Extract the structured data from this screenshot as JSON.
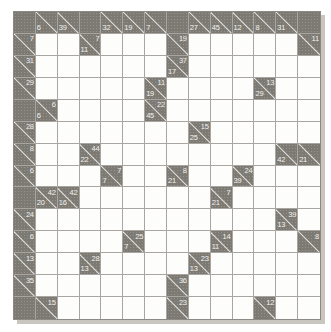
{
  "puzzle": {
    "type": "kakuro",
    "title": "Kakuro puzzle grid",
    "rows": 14,
    "cols": 14,
    "colors": {
      "block": "#7d7a74",
      "open": "#fdfdfb",
      "grid_line": "#a9a6a1",
      "clue_text": "#f2f1ee",
      "shadow": "#c9c6c0"
    },
    "legend": {
      "across_label": "across-clue",
      "down_label": "down-clue"
    },
    "cells": [
      [
        {
          "t": "block"
        },
        {
          "t": "clue",
          "down": "6"
        },
        {
          "t": "clue",
          "down": "39"
        },
        {
          "t": "block"
        },
        {
          "t": "clue",
          "down": "32"
        },
        {
          "t": "clue",
          "down": "19"
        },
        {
          "t": "clue",
          "down": "7"
        },
        {
          "t": "block"
        },
        {
          "t": "clue",
          "down": "27"
        },
        {
          "t": "clue",
          "down": "45"
        },
        {
          "t": "clue",
          "down": "12"
        },
        {
          "t": "clue",
          "down": "8"
        },
        {
          "t": "clue",
          "down": "31"
        },
        {
          "t": "block"
        }
      ],
      [
        {
          "t": "clue",
          "across": "7"
        },
        {
          "t": "open"
        },
        {
          "t": "open"
        },
        {
          "t": "clue",
          "across": "7",
          "down": "11"
        },
        {
          "t": "open"
        },
        {
          "t": "open"
        },
        {
          "t": "open"
        },
        {
          "t": "clue",
          "across": "19"
        },
        {
          "t": "open"
        },
        {
          "t": "open"
        },
        {
          "t": "open"
        },
        {
          "t": "open"
        },
        {
          "t": "open"
        },
        {
          "t": "clue",
          "across": "11"
        }
      ],
      [
        {
          "t": "clue",
          "across": "31"
        },
        {
          "t": "open"
        },
        {
          "t": "open"
        },
        {
          "t": "open"
        },
        {
          "t": "open"
        },
        {
          "t": "open"
        },
        {
          "t": "open"
        },
        {
          "t": "clue",
          "across": "37",
          "down": "17"
        },
        {
          "t": "open"
        },
        {
          "t": "open"
        },
        {
          "t": "open"
        },
        {
          "t": "open"
        },
        {
          "t": "open"
        },
        {
          "t": "open"
        }
      ],
      [
        {
          "t": "clue",
          "across": "29"
        },
        {
          "t": "open"
        },
        {
          "t": "open"
        },
        {
          "t": "open"
        },
        {
          "t": "open"
        },
        {
          "t": "open"
        },
        {
          "t": "clue",
          "across": "11",
          "down": "19"
        },
        {
          "t": "open"
        },
        {
          "t": "open"
        },
        {
          "t": "open"
        },
        {
          "t": "open"
        },
        {
          "t": "clue",
          "across": "13",
          "down": "29"
        },
        {
          "t": "open"
        },
        {
          "t": "open"
        }
      ],
      [
        {
          "t": "block"
        },
        {
          "t": "clue",
          "across": "6",
          "down": "6"
        },
        {
          "t": "open"
        },
        {
          "t": "open"
        },
        {
          "t": "open"
        },
        {
          "t": "open"
        },
        {
          "t": "clue",
          "across": "22",
          "down": "45"
        },
        {
          "t": "open"
        },
        {
          "t": "open"
        },
        {
          "t": "open"
        },
        {
          "t": "open"
        },
        {
          "t": "open"
        },
        {
          "t": "open"
        },
        {
          "t": "open"
        }
      ],
      [
        {
          "t": "clue",
          "across": "28"
        },
        {
          "t": "open"
        },
        {
          "t": "open"
        },
        {
          "t": "open"
        },
        {
          "t": "open"
        },
        {
          "t": "open"
        },
        {
          "t": "open"
        },
        {
          "t": "open"
        },
        {
          "t": "clue",
          "across": "15",
          "down": "25"
        },
        {
          "t": "open"
        },
        {
          "t": "open"
        },
        {
          "t": "open"
        },
        {
          "t": "open"
        },
        {
          "t": "open"
        }
      ],
      [
        {
          "t": "clue",
          "across": "8"
        },
        {
          "t": "open"
        },
        {
          "t": "open"
        },
        {
          "t": "clue",
          "across": "44",
          "down": "22"
        },
        {
          "t": "open"
        },
        {
          "t": "open"
        },
        {
          "t": "open"
        },
        {
          "t": "open"
        },
        {
          "t": "open"
        },
        {
          "t": "open"
        },
        {
          "t": "open"
        },
        {
          "t": "open"
        },
        {
          "t": "clue",
          "down": "42"
        },
        {
          "t": "clue",
          "down": "21"
        }
      ],
      [
        {
          "t": "clue",
          "across": "6"
        },
        {
          "t": "open"
        },
        {
          "t": "open"
        },
        {
          "t": "open"
        },
        {
          "t": "clue",
          "across": "7",
          "down": "7"
        },
        {
          "t": "open"
        },
        {
          "t": "open"
        },
        {
          "t": "clue",
          "across": "8",
          "down": "21"
        },
        {
          "t": "open"
        },
        {
          "t": "open"
        },
        {
          "t": "clue",
          "across": "24",
          "down": "39"
        },
        {
          "t": "open"
        },
        {
          "t": "open"
        },
        {
          "t": "open"
        }
      ],
      [
        {
          "t": "block"
        },
        {
          "t": "clue",
          "across": "42",
          "down": "20"
        },
        {
          "t": "clue",
          "across": "42",
          "down": "16"
        },
        {
          "t": "open"
        },
        {
          "t": "open"
        },
        {
          "t": "open"
        },
        {
          "t": "open"
        },
        {
          "t": "open"
        },
        {
          "t": "open"
        },
        {
          "t": "clue",
          "across": "7",
          "down": "21"
        },
        {
          "t": "open"
        },
        {
          "t": "open"
        },
        {
          "t": "open"
        },
        {
          "t": "open"
        }
      ],
      [
        {
          "t": "clue",
          "across": "24"
        },
        {
          "t": "open"
        },
        {
          "t": "open"
        },
        {
          "t": "open"
        },
        {
          "t": "open"
        },
        {
          "t": "open"
        },
        {
          "t": "open"
        },
        {
          "t": "open"
        },
        {
          "t": "open"
        },
        {
          "t": "open"
        },
        {
          "t": "open"
        },
        {
          "t": "open"
        },
        {
          "t": "clue",
          "across": "39",
          "down": "13"
        },
        {
          "t": "open"
        }
      ],
      [
        {
          "t": "clue",
          "across": "6"
        },
        {
          "t": "open"
        },
        {
          "t": "open"
        },
        {
          "t": "open"
        },
        {
          "t": "open"
        },
        {
          "t": "clue",
          "across": "25",
          "down": "7"
        },
        {
          "t": "open"
        },
        {
          "t": "open"
        },
        {
          "t": "open"
        },
        {
          "t": "clue",
          "across": "14",
          "down": "11"
        },
        {
          "t": "open"
        },
        {
          "t": "open"
        },
        {
          "t": "open"
        },
        {
          "t": "clue",
          "across": "8"
        }
      ],
      [
        {
          "t": "clue",
          "across": "13"
        },
        {
          "t": "open"
        },
        {
          "t": "open"
        },
        {
          "t": "clue",
          "across": "28",
          "down": "13"
        },
        {
          "t": "open"
        },
        {
          "t": "open"
        },
        {
          "t": "open"
        },
        {
          "t": "open"
        },
        {
          "t": "clue",
          "across": "23",
          "down": "13"
        },
        {
          "t": "open"
        },
        {
          "t": "open"
        },
        {
          "t": "open"
        },
        {
          "t": "open"
        },
        {
          "t": "open"
        }
      ],
      [
        {
          "t": "clue",
          "across": "35"
        },
        {
          "t": "open"
        },
        {
          "t": "open"
        },
        {
          "t": "open"
        },
        {
          "t": "open"
        },
        {
          "t": "open"
        },
        {
          "t": "open"
        },
        {
          "t": "clue",
          "across": "36"
        },
        {
          "t": "open"
        },
        {
          "t": "open"
        },
        {
          "t": "open"
        },
        {
          "t": "open"
        },
        {
          "t": "open"
        },
        {
          "t": "open"
        }
      ],
      [
        {
          "t": "block"
        },
        {
          "t": "clue",
          "across": "15"
        },
        {
          "t": "open"
        },
        {
          "t": "open"
        },
        {
          "t": "open"
        },
        {
          "t": "open"
        },
        {
          "t": "open"
        },
        {
          "t": "clue",
          "across": "23"
        },
        {
          "t": "open"
        },
        {
          "t": "open"
        },
        {
          "t": "open"
        },
        {
          "t": "clue",
          "across": "12"
        },
        {
          "t": "open"
        },
        {
          "t": "open"
        }
      ]
    ]
  }
}
